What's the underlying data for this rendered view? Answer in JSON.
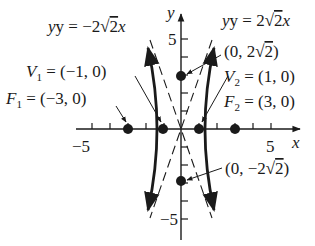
{
  "figure": {
    "type": "hyperbola-graph",
    "axes": {
      "x_label": "x",
      "y_label": "y",
      "x_tick_label_neg": "−5",
      "x_tick_label_pos": "5",
      "y_tick_label_pos": "5",
      "y_tick_label_neg": "−5"
    },
    "asymptotes": {
      "left": {
        "lhs": "y = −2",
        "rad": "2",
        "var": "x"
      },
      "right": {
        "lhs": "y = 2",
        "rad": "2",
        "var": "x"
      }
    },
    "points": {
      "V1": {
        "name": "V",
        "sub": "1",
        "text": " = (−1, 0)"
      },
      "V2": {
        "name": "V",
        "sub": "2",
        "text": " = (1, 0)"
      },
      "F1": {
        "name": "F",
        "sub": "1",
        "text": " = (−3, 0)"
      },
      "F2": {
        "name": "F",
        "sub": "2",
        "text": " = (3, 0)"
      },
      "B1": {
        "pre": "(0, 2",
        "rad": "2",
        "post": ")"
      },
      "B2": {
        "pre": "(0, −2",
        "rad": "2",
        "post": ")"
      }
    },
    "colors": {
      "ink": "#1a1a1a",
      "background": "#ffffff"
    }
  }
}
